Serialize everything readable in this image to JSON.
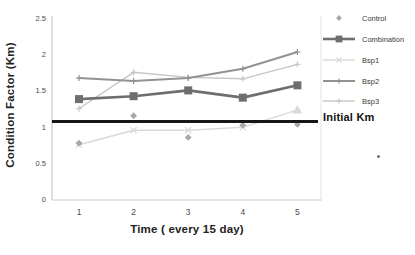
{
  "chart_data": {
    "type": "line",
    "title": "",
    "xlabel": "Time ( every 15 day)",
    "ylabel": "Condition Factor (Km)",
    "x": [
      1,
      2,
      3,
      4,
      5
    ],
    "ylim": [
      0,
      2.5
    ],
    "yticks": [
      0,
      0.5,
      1,
      1.5,
      2,
      2.5
    ],
    "grid": false,
    "legend_position": "right",
    "series": [
      {
        "name": "Control",
        "values": [
          0.77,
          1.15,
          0.85,
          1.02,
          1.03
        ],
        "marker": "diamond",
        "line": false,
        "width": 0,
        "color": "#a8a8a8"
      },
      {
        "name": "Combination",
        "values": [
          1.38,
          1.42,
          1.5,
          1.4,
          1.57
        ],
        "marker": "square",
        "line": true,
        "width": 2.6,
        "color": "#6e6e6e"
      },
      {
        "name": "Bsp1",
        "values": [
          0.75,
          0.95,
          0.95,
          0.99,
          1.23
        ],
        "marker": "x",
        "last_marker": "triangle",
        "line": true,
        "width": 1.4,
        "color": "#d9d9d9"
      },
      {
        "name": "Bsp2",
        "values": [
          1.67,
          1.63,
          1.67,
          1.8,
          2.03
        ],
        "marker": "plus",
        "line": true,
        "width": 2.0,
        "color": "#929292"
      },
      {
        "name": "Bsp3",
        "values": [
          1.25,
          1.75,
          1.68,
          1.66,
          1.86
        ],
        "marker": "plus",
        "line": true,
        "width": 1.4,
        "color": "#c6c6c6"
      }
    ],
    "reference_line": {
      "label": "Initial Km",
      "value": 1.07,
      "color": "#161616"
    }
  },
  "colors": {
    "axis": "#c9c9c9",
    "axis_right": "#e3e3e3",
    "tick_text": "#4a4a4a"
  },
  "stray_mark": "."
}
